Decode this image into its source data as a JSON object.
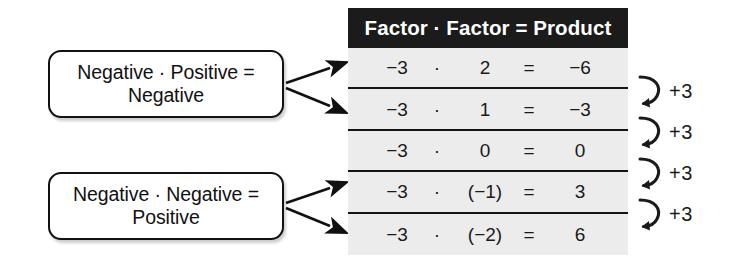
{
  "figure": {
    "type": "math-illustration",
    "background_color": "#ffffff",
    "accent_color": "#1b1b1b",
    "table_body_color": "#ececec"
  },
  "callouts": [
    {
      "id": "negative-times-positive",
      "line1": "Negative · Positive =",
      "line2": "Negative",
      "arrow_count": 2
    },
    {
      "id": "negative-times-negative",
      "line1": "Negative · Negative =",
      "line2": "Positive",
      "arrow_count": 2
    }
  ],
  "table": {
    "header": "Factor · Factor = Product",
    "columns": [
      "Factor",
      "operator",
      "Factor",
      "equals",
      "Product"
    ],
    "rows": [
      {
        "factor1": "−3",
        "operator": "·",
        "factor2": "2",
        "equals": "=",
        "product": "−6"
      },
      {
        "factor1": "−3",
        "operator": "·",
        "factor2": "1",
        "equals": "=",
        "product": "−3"
      },
      {
        "factor1": "−3",
        "operator": "·",
        "factor2": "0",
        "equals": "=",
        "product": "0"
      },
      {
        "factor1": "−3",
        "operator": "·",
        "factor2": "(−1)",
        "equals": "=",
        "product": "3"
      },
      {
        "factor1": "−3",
        "operator": "·",
        "factor2": "(−2)",
        "equals": "=",
        "product": "6"
      }
    ]
  },
  "annotations": {
    "step_labels": [
      "+3",
      "+3",
      "+3",
      "+3"
    ],
    "icon": "curved-down-arrow-icon"
  }
}
